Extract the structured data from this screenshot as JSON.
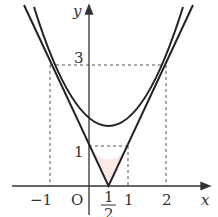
{
  "diagram": {
    "axes": {
      "x_label": "x",
      "y_label": "y",
      "origin_label": "O"
    },
    "x_ticks": [
      "−1",
      "1",
      "2"
    ],
    "half_tick": {
      "numerator": "1",
      "denominator": "2"
    },
    "y_ticks": [
      "1",
      "3"
    ],
    "curves": [
      {
        "name": "parabola",
        "equation": "y = x^2 - x + 1"
      },
      {
        "name": "v-shape",
        "equation": "y = |2x - 1|"
      }
    ],
    "intersection_points": [
      [
        -1,
        3
      ],
      [
        0,
        1
      ],
      [
        1,
        1
      ],
      [
        2,
        3
      ]
    ],
    "shaded_region": {
      "between": "parabola and v-shape",
      "x_range": [
        0,
        1
      ],
      "color": "#fbe9e7"
    },
    "colors": {
      "line": "#222222",
      "guides": "#555555",
      "shade": "#fbe9e7"
    }
  }
}
